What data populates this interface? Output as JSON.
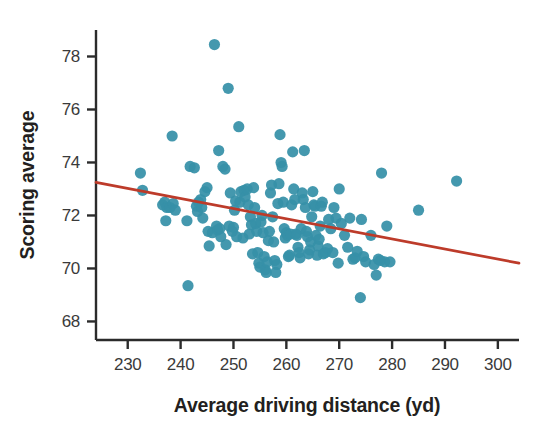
{
  "chart_data": {
    "type": "scatter",
    "title": "",
    "xlabel": "Average driving distance (yd)",
    "ylabel": "Scoring average",
    "xlim": [
      224,
      304
    ],
    "ylim": [
      67.3,
      79.0
    ],
    "xticks": [
      230,
      240,
      250,
      260,
      270,
      280,
      290,
      300
    ],
    "yticks": [
      68,
      70,
      72,
      74,
      76,
      78
    ],
    "grid": false,
    "legend": null,
    "marker_color": "#3690a8",
    "marker_size": 7,
    "trendline": {
      "type": "linear",
      "color": "#bd3b2a",
      "x_start": 224.0,
      "y_start": 73.25,
      "x_end": 304.0,
      "y_end": 70.2,
      "slope": -0.0381,
      "intercept": 81.78
    },
    "x": [
      232.4,
      232.8,
      236.6,
      237.0,
      237.4,
      237.2,
      238.0,
      238.6,
      238.4,
      239.0,
      241.2,
      241.4,
      241.8,
      242.6,
      243.0,
      243.4,
      243.2,
      243.8,
      244.0,
      244.2,
      244.6,
      245.0,
      245.4,
      245.2,
      246.0,
      246.4,
      246.8,
      247.0,
      247.4,
      247.2,
      247.6,
      248.0,
      248.4,
      248.6,
      249.0,
      249.4,
      249.2,
      249.8,
      250.0,
      250.2,
      250.4,
      250.6,
      251.0,
      251.4,
      251.2,
      251.8,
      252.0,
      252.2,
      252.6,
      252.8,
      253.0,
      253.2,
      253.4,
      253.6,
      253.8,
      254.0,
      254.2,
      254.4,
      254.6,
      254.8,
      255.0,
      255.2,
      255.4,
      255.6,
      255.8,
      256.0,
      256.2,
      256.4,
      256.6,
      256.8,
      257.0,
      257.2,
      257.4,
      257.6,
      257.8,
      258.0,
      258.2,
      258.4,
      258.6,
      258.8,
      259.0,
      259.2,
      259.4,
      259.6,
      259.8,
      260.0,
      260.2,
      260.4,
      260.6,
      260.8,
      261.0,
      261.2,
      261.4,
      261.6,
      261.8,
      262.0,
      262.2,
      262.4,
      262.6,
      262.8,
      263.0,
      263.2,
      263.4,
      263.6,
      263.8,
      264.0,
      264.2,
      264.4,
      264.6,
      264.8,
      265.0,
      265.2,
      265.4,
      265.6,
      265.8,
      266.0,
      266.2,
      266.4,
      266.6,
      266.8,
      267.0,
      267.4,
      267.8,
      268.0,
      268.4,
      268.8,
      269.0,
      269.4,
      269.8,
      270.0,
      270.4,
      271.0,
      271.6,
      272.0,
      272.6,
      273.0,
      273.4,
      274.0,
      274.2,
      274.6,
      275.0,
      276.0,
      276.6,
      277.0,
      277.4,
      277.8,
      278.0,
      278.6,
      279.0,
      279.6,
      285.0,
      292.2
    ],
    "y": [
      73.6,
      72.95,
      72.4,
      72.5,
      72.3,
      71.8,
      72.3,
      72.45,
      75.0,
      72.2,
      71.8,
      69.35,
      73.85,
      73.8,
      72.35,
      72.5,
      72.15,
      72.6,
      72.3,
      71.9,
      72.9,
      73.05,
      70.85,
      71.4,
      71.35,
      78.45,
      71.6,
      71.45,
      71.5,
      74.45,
      71.2,
      73.85,
      73.75,
      70.9,
      76.8,
      72.85,
      71.6,
      71.4,
      71.55,
      72.2,
      72.55,
      71.2,
      75.35,
      72.9,
      72.5,
      71.15,
      72.95,
      72.7,
      73.0,
      72.4,
      71.3,
      71.95,
      71.65,
      70.55,
      73.05,
      72.3,
      71.7,
      71.4,
      70.6,
      70.2,
      70.05,
      71.75,
      72.0,
      71.35,
      70.45,
      69.95,
      69.85,
      70.25,
      71.05,
      71.4,
      72.85,
      73.15,
      71.95,
      71.0,
      70.3,
      69.85,
      70.15,
      72.45,
      73.2,
      75.05,
      74.0,
      73.85,
      72.5,
      71.5,
      71.15,
      71.35,
      71.25,
      70.45,
      70.5,
      71.3,
      72.4,
      74.4,
      73.0,
      72.6,
      71.3,
      71.25,
      70.8,
      70.6,
      70.4,
      71.5,
      72.85,
      72.6,
      74.45,
      72.3,
      71.4,
      71.2,
      70.55,
      70.7,
      71.0,
      71.95,
      72.9,
      72.4,
      72.35,
      71.25,
      70.5,
      70.85,
      71.1,
      71.6,
      72.35,
      72.5,
      70.55,
      70.6,
      70.75,
      71.85,
      71.5,
      70.6,
      72.3,
      71.9,
      70.2,
      73.0,
      71.7,
      71.25,
      70.8,
      71.9,
      70.35,
      70.4,
      70.65,
      68.9,
      71.85,
      70.45,
      70.25,
      71.25,
      70.15,
      69.75,
      70.35,
      70.3,
      73.6,
      70.25,
      71.6,
      70.25,
      72.2,
      73.3
    ]
  },
  "axis": {
    "x_tick_labels": [
      "230",
      "240",
      "250",
      "260",
      "270",
      "280",
      "290",
      "300"
    ],
    "y_tick_labels": [
      "78",
      "76",
      "74",
      "72",
      "70",
      "68"
    ],
    "x_title": "Average driving distance (yd)",
    "y_title": "Scoring average",
    "axis_color": "#2b2b2b",
    "tick_color": "#2b2b2b"
  }
}
